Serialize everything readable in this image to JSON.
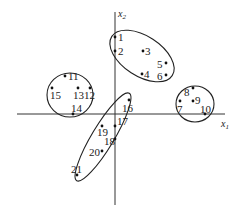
{
  "axes": {
    "x_label": "x",
    "x_sub": "1",
    "y_label": "x",
    "y_sub": "2",
    "color": "#333333"
  },
  "points": [
    {
      "id": "1",
      "label": "1",
      "x": 115,
      "y": 37,
      "lx": 118,
      "ly": 41
    },
    {
      "id": "2",
      "label": "2",
      "x": 115,
      "y": 51,
      "lx": 118,
      "ly": 55
    },
    {
      "id": "3",
      "label": "3",
      "x": 143,
      "y": 51,
      "lx": 145,
      "ly": 55
    },
    {
      "id": "4",
      "label": "4",
      "x": 142,
      "y": 74,
      "lx": 144,
      "ly": 78
    },
    {
      "id": "5",
      "label": "5",
      "x": 166,
      "y": 63,
      "lx": 157,
      "ly": 68
    },
    {
      "id": "6",
      "label": "6",
      "x": 166,
      "y": 75,
      "lx": 157,
      "ly": 80
    },
    {
      "id": "7",
      "label": "7",
      "x": 180,
      "y": 101,
      "lx": 177,
      "ly": 113
    },
    {
      "id": "8",
      "label": "8",
      "x": 193,
      "y": 88,
      "lx": 184,
      "ly": 96
    },
    {
      "id": "9",
      "label": "9",
      "x": 193,
      "y": 101,
      "lx": 195,
      "ly": 104
    },
    {
      "id": "10",
      "label": "10",
      "x": 205,
      "y": 114,
      "lx": 200,
      "ly": 113
    },
    {
      "id": "11",
      "label": "11",
      "x": 65,
      "y": 76,
      "lx": 68,
      "ly": 80
    },
    {
      "id": "12",
      "label": "12",
      "x": 90,
      "y": 88,
      "lx": 84,
      "ly": 99
    },
    {
      "id": "13",
      "label": "13",
      "x": 78,
      "y": 88,
      "lx": 73,
      "ly": 99
    },
    {
      "id": "14",
      "label": "14",
      "x": 73,
      "y": 114,
      "lx": 71,
      "ly": 112
    },
    {
      "id": "15",
      "label": "15",
      "x": 52,
      "y": 88,
      "lx": 50,
      "ly": 99
    },
    {
      "id": "16",
      "label": "16",
      "x": 129,
      "y": 100,
      "lx": 122,
      "ly": 112
    },
    {
      "id": "17",
      "label": "17",
      "x": 115,
      "y": 126,
      "lx": 117,
      "ly": 125
    },
    {
      "id": "18",
      "label": "18",
      "x": 115,
      "y": 139,
      "lx": 104,
      "ly": 145
    },
    {
      "id": "19",
      "label": "19",
      "x": 102,
      "y": 126,
      "lx": 97,
      "ly": 136
    },
    {
      "id": "20",
      "label": "20",
      "x": 102,
      "y": 151,
      "lx": 89,
      "ly": 156
    },
    {
      "id": "21",
      "label": "21",
      "x": 77,
      "y": 175,
      "lx": 71,
      "ly": 173
    }
  ],
  "clusters": [
    {
      "id": "A",
      "members": [
        "1",
        "2",
        "3",
        "4",
        "5",
        "6"
      ],
      "cx": 142,
      "cy": 56,
      "rx": 36,
      "ry": 20,
      "rot": 33
    },
    {
      "id": "B",
      "members": [
        "11",
        "12",
        "13",
        "14",
        "15"
      ],
      "cx": 70,
      "cy": 95,
      "rx": 23,
      "ry": 22,
      "rot": 0
    },
    {
      "id": "C",
      "members": [
        "7",
        "8",
        "9",
        "10"
      ],
      "cx": 195,
      "cy": 104,
      "rx": 19,
      "ry": 18,
      "rot": 0
    },
    {
      "id": "D",
      "members": [
        "16",
        "17",
        "18",
        "19",
        "20",
        "21"
      ],
      "cx": 103,
      "cy": 137,
      "rx": 51,
      "ry": 11,
      "rot": -59
    }
  ]
}
